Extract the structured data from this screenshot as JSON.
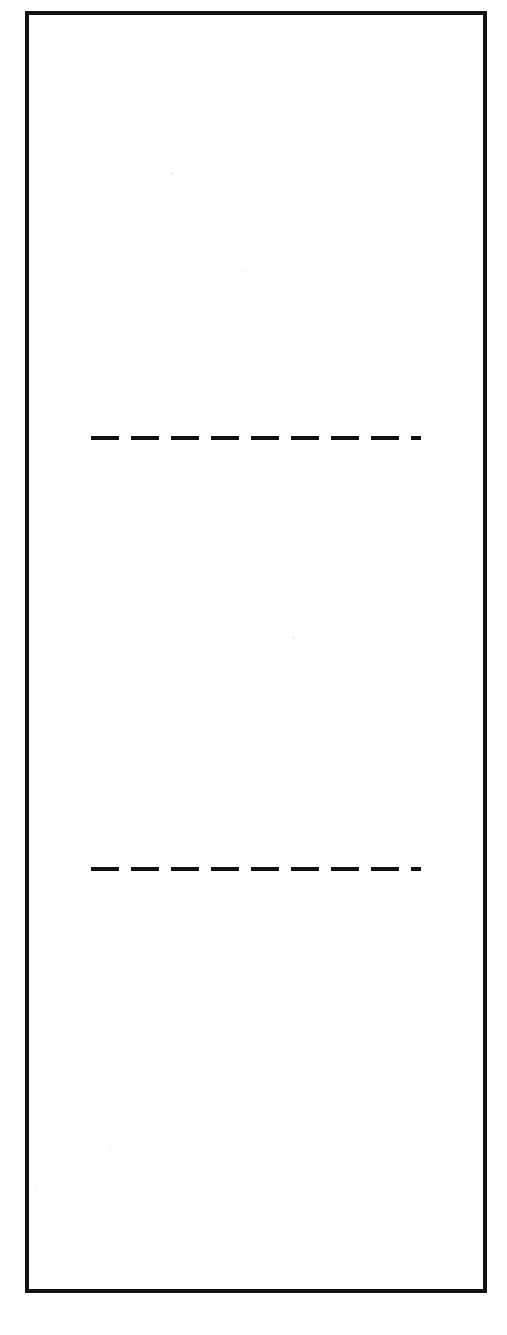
{
  "figure": {
    "canvas_width": 507,
    "canvas_height": 1335,
    "background_color": "#ffffff",
    "ink_color": "#111111"
  },
  "outer_rectangle": {
    "name": "outer-rectangle",
    "left": 25,
    "top": 11,
    "width": 462,
    "height": 1282,
    "border_width": 4,
    "border_style": "solid",
    "border_color": "#111111",
    "fill_color": "#ffffff"
  },
  "dashed_lines": [
    {
      "label": "upper-dashed-line",
      "left": 91,
      "top": 436,
      "width": 330,
      "thickness": 4,
      "dash_length": 28,
      "gap_length": 12,
      "dash_count": 9,
      "color": "#111111"
    },
    {
      "label": "lower-dashed-line",
      "left": 91,
      "top": 867,
      "width": 330,
      "thickness": 4,
      "dash_length": 28,
      "gap_length": 12,
      "dash_count": 9,
      "color": "#111111"
    }
  ],
  "scan_specks": [
    {
      "left": 170,
      "top": 172,
      "size": 3
    },
    {
      "left": 293,
      "top": 258,
      "size": 2
    },
    {
      "left": 242,
      "top": 270,
      "size": 2
    },
    {
      "left": 175,
      "top": 370,
      "size": 2
    },
    {
      "left": 292,
      "top": 636,
      "size": 3
    },
    {
      "left": 297,
      "top": 700,
      "size": 2
    },
    {
      "left": 175,
      "top": 765,
      "size": 2
    },
    {
      "left": 404,
      "top": 346,
      "size": 2
    },
    {
      "left": 380,
      "top": 1090,
      "size": 2
    },
    {
      "left": 110,
      "top": 1148,
      "size": 2
    },
    {
      "left": 35,
      "top": 1185,
      "size": 2
    },
    {
      "left": 60,
      "top": 980,
      "size": 2
    }
  ]
}
